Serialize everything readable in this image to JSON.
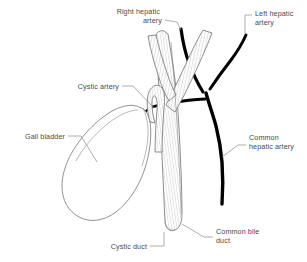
{
  "diagram": {
    "background_color": "#ffffff",
    "line_color": "#6e6e6e",
    "artery_color": "#000000",
    "label_color": "#4a4a4a"
  },
  "labels": {
    "right_hepatic_artery": {
      "line1": "Right hepatic",
      "line2": "artery"
    },
    "left_hepatic_artery": {
      "line1": "Left hepatic",
      "line2": "artery"
    },
    "cystic_artery": {
      "line1": "Cystic artery"
    },
    "gall_bladder": {
      "line1": "Gall bladder"
    },
    "common_hepatic_artery": {
      "line1": "Common",
      "line2": "hepatic artery"
    },
    "cystic_duct": {
      "line1": "Cystic duct"
    },
    "common_bile_duct": {
      "line1": "Common bile",
      "line2": "duct"
    }
  },
  "structures": {
    "gall_bladder": "gall-bladder",
    "cystic_duct": "cystic-duct",
    "common_bile_duct": "common-bile-duct",
    "common_hepatic_duct": "common-hepatic-duct",
    "right_hepatic_artery": "right-hepatic-artery",
    "left_hepatic_artery": "left-hepatic-artery",
    "common_hepatic_artery": "common-hepatic-artery",
    "cystic_artery": "cystic-artery"
  }
}
